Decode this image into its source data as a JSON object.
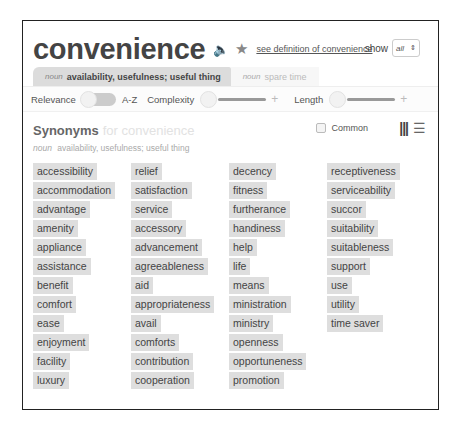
{
  "header": {
    "word": "convenience",
    "audio_icon": "speaker-icon",
    "star_icon": "star-icon",
    "definition_link": "see definition of convenience",
    "show_label": "show",
    "show_value": "all"
  },
  "tabs": [
    {
      "pos": "noun",
      "sense": "availability, usefulness; useful thing",
      "active": true
    },
    {
      "pos": "noun",
      "sense": "spare time",
      "active": false
    }
  ],
  "filters": {
    "relevance": "Relevance",
    "az": "A-Z",
    "complexity": "Complexity",
    "length": "Length",
    "plus": "+"
  },
  "synonyms": {
    "title": "Synonyms",
    "for_text": "for convenience",
    "common_label": "Common",
    "informal_label": "Informal",
    "subhead_pos": "noun",
    "subhead_sense": "availability, usefulness; useful thing",
    "columns": [
      [
        "accessibility",
        "accommodation",
        "advantage",
        "amenity",
        "appliance",
        "assistance",
        "benefit",
        "comfort",
        "ease",
        "enjoyment",
        "facility",
        "luxury"
      ],
      [
        "relief",
        "satisfaction",
        "service",
        "accessory",
        "advancement",
        "agreeableness",
        "aid",
        "appropriateness",
        "avail",
        "comforts",
        "contribution",
        "cooperation"
      ],
      [
        "decency",
        "fitness",
        "furtherance",
        "handiness",
        "help",
        "life",
        "means",
        "ministration",
        "ministry",
        "openness",
        "opportuneness",
        "promotion"
      ],
      [
        "receptiveness",
        "serviceability",
        "succor",
        "suitability",
        "suitableness",
        "support",
        "use",
        "utility",
        "time saver"
      ]
    ]
  }
}
